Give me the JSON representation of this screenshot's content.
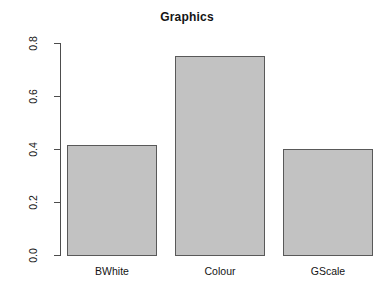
{
  "chart_data": {
    "type": "bar",
    "title": "Graphics",
    "xlabel": "",
    "ylabel": "Mean error rate",
    "categories": [
      "BWhite",
      "Colour",
      "GScale"
    ],
    "values": [
      0.415,
      0.75,
      0.4
    ],
    "ylim": [
      0.0,
      0.8
    ],
    "ytick_labels": [
      "0.0",
      "0.2",
      "0.4",
      "0.6",
      "0.8"
    ],
    "ytick_values": [
      0.0,
      0.2,
      0.4,
      0.6,
      0.8
    ],
    "grid": false,
    "legend": false,
    "bar_fill_color": "#c2c2c2",
    "bar_border_color": "#595959",
    "axis_color": "#4d4d4d",
    "background_color": "#ffffff"
  }
}
